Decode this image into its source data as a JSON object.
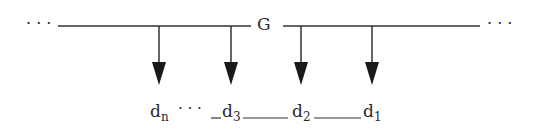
{
  "diagram": {
    "bus_label": "G",
    "left_ellipsis": "· · ·",
    "right_ellipsis": "· · ·",
    "outputs": [
      {
        "base": "d",
        "sub": "n"
      },
      {
        "base": "d",
        "sub": "3"
      },
      {
        "base": "d",
        "sub": "2"
      },
      {
        "base": "d",
        "sub": "1"
      }
    ],
    "between_n_3": "· · ·",
    "colors": {
      "line": "#333333",
      "text": "#2a2a2a",
      "background": "#ffffff"
    }
  }
}
